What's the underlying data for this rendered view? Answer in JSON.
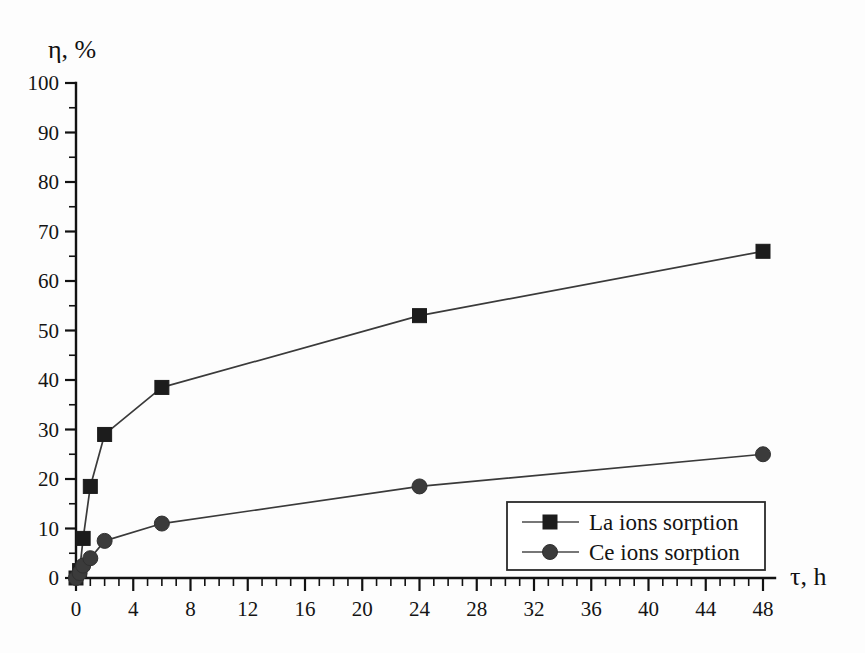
{
  "chart_data": {
    "type": "line",
    "title": "",
    "xlabel": "τ, h",
    "ylabel": "η, %",
    "xlim": [
      0,
      48
    ],
    "ylim": [
      0,
      100
    ],
    "xticks": [
      0,
      4,
      8,
      12,
      16,
      20,
      24,
      28,
      32,
      36,
      40,
      44,
      48
    ],
    "yticks": [
      0,
      10,
      20,
      30,
      40,
      50,
      60,
      70,
      80,
      90,
      100
    ],
    "x_minor_step": 1,
    "y_minor_step": 5,
    "grid": false,
    "legend_position": "lower-right",
    "series": [
      {
        "name": "La ions sorption",
        "marker": "square",
        "color": "#1c1c1c",
        "x": [
          0,
          0.25,
          0.5,
          1,
          2,
          6,
          24,
          48
        ],
        "y": [
          0,
          1.5,
          8,
          18.5,
          29,
          38.5,
          53,
          66
        ]
      },
      {
        "name": "Ce ions sorption",
        "marker": "circle",
        "color": "#3b3b3b",
        "x": [
          0,
          0.25,
          0.5,
          1,
          2,
          6,
          24,
          48
        ],
        "y": [
          0,
          1,
          2.5,
          4,
          7.5,
          11,
          18.5,
          25
        ]
      }
    ]
  },
  "axes": {
    "y_axis_title": "η, %",
    "x_axis_title": "τ, h"
  },
  "legend": {
    "entries": [
      {
        "label": "La ions sorption",
        "marker": "square"
      },
      {
        "label": "Ce ions sorption",
        "marker": "circle"
      }
    ]
  }
}
